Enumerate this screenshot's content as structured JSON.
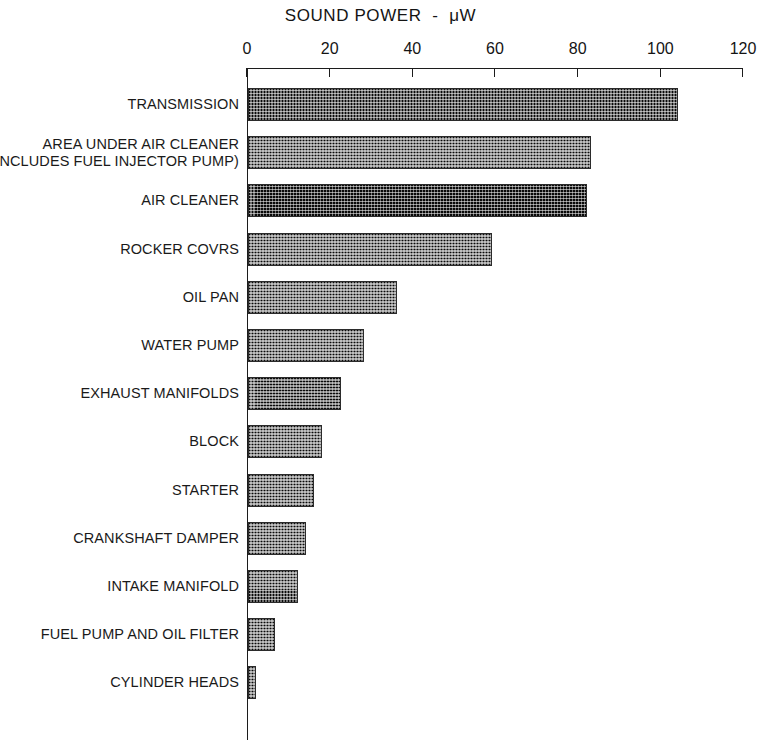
{
  "chart_data": {
    "type": "bar",
    "orientation": "horizontal",
    "title": "SOUND POWER  -  μW",
    "xlabel": "",
    "ylabel": "",
    "xlim": [
      0,
      120
    ],
    "grid": false,
    "legend": null,
    "tick_labels": [
      "0",
      "20",
      "40",
      "60",
      "80",
      "100",
      "120"
    ],
    "tick_values": [
      0,
      20,
      40,
      60,
      80,
      100,
      120
    ],
    "categories": [
      "TRANSMISSION",
      "AREA UNDER AIR CLEANER\n(INCLUDES FUEL INJECTOR PUMP)",
      "AIR CLEANER",
      "ROCKER COVRS",
      "OIL PAN",
      "WATER PUMP",
      "EXHAUST MANIFOLDS",
      "BLOCK",
      "STARTER",
      "CRANKSHAFT DAMPER",
      "INTAKE MANIFOLD",
      "FUEL PUMP AND OIL FILTER",
      "CYLINDER HEADS"
    ],
    "values": [
      104,
      83,
      82,
      59,
      36,
      28,
      22.5,
      18,
      16,
      14,
      12,
      6.5,
      2
    ],
    "bar_fill": "#6f6f6f",
    "bar_edge": "#2b2b2b",
    "axis_color": "#1c1c1c",
    "background": "#ffffff"
  },
  "bars": [
    {
      "label": "TRANSMISSION",
      "value": 104
    },
    {
      "label": "AREA UNDER AIR CLEANER\n(INCLUDES FUEL INJECTOR PUMP)",
      "value": 83
    },
    {
      "label": "AIR CLEANER",
      "value": 82
    },
    {
      "label": "ROCKER COVRS",
      "value": 59
    },
    {
      "label": "OIL PAN",
      "value": 36
    },
    {
      "label": "WATER PUMP",
      "value": 28
    },
    {
      "label": "EXHAUST MANIFOLDS",
      "value": 22.5
    },
    {
      "label": "BLOCK",
      "value": 18
    },
    {
      "label": "STARTER",
      "value": 16
    },
    {
      "label": "CRANKSHAFT DAMPER",
      "value": 14
    },
    {
      "label": "INTAKE MANIFOLD",
      "value": 12
    },
    {
      "label": "FUEL PUMP AND OIL FILTER",
      "value": 6.5
    },
    {
      "label": "CYLINDER HEADS",
      "value": 2
    }
  ],
  "axis": {
    "ticks": [
      {
        "label": "0",
        "value": 0
      },
      {
        "label": "20",
        "value": 20
      },
      {
        "label": "40",
        "value": 40
      },
      {
        "label": "60",
        "value": 60
      },
      {
        "label": "80",
        "value": 80
      },
      {
        "label": "100",
        "value": 100
      },
      {
        "label": "120",
        "value": 120
      }
    ]
  }
}
